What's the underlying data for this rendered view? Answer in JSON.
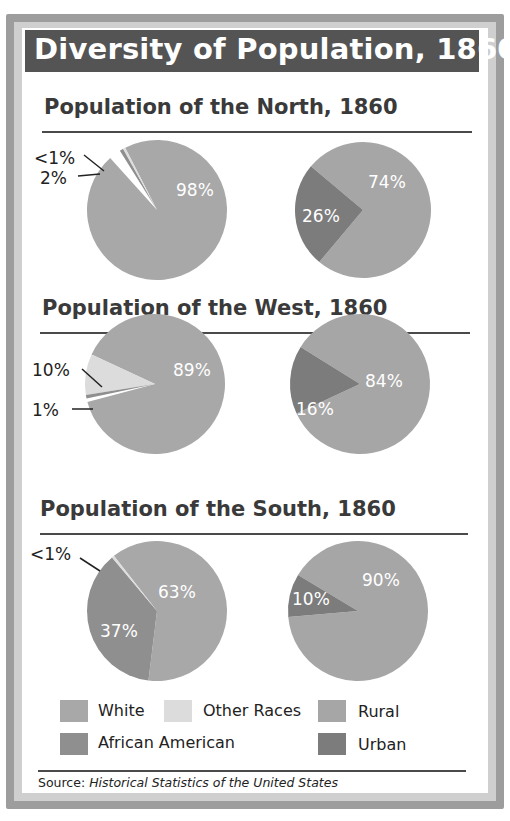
{
  "title": "Diversity of Population, 1860",
  "colors": {
    "white": "#a8a8a8",
    "african_american": "#8f8f8f",
    "other_races": "#dcdcdc",
    "rural": "#a6a6a6",
    "urban": "#7c7c7c",
    "title_bar": "#545454"
  },
  "sections": [
    {
      "heading": "Population of the North, 1860"
    },
    {
      "heading": "Population of the West, 1860"
    },
    {
      "heading": "Population of the South, 1860"
    }
  ],
  "legend": {
    "white": "White",
    "other_races": "Other Races",
    "rural": "Rural",
    "african_american": "African American",
    "urban": "Urban"
  },
  "source": {
    "prefix": "Source: ",
    "title": "Historical Statistics of the United States"
  },
  "chart_data": [
    {
      "type": "pie",
      "title": "Population of the North, 1860 — Race",
      "slices": [
        {
          "label": "White",
          "value": 98,
          "display": "98%"
        },
        {
          "label": "African American",
          "value": 2,
          "display": "2%"
        },
        {
          "label": "Other Races",
          "value": 0.5,
          "display": "<1%"
        }
      ]
    },
    {
      "type": "pie",
      "title": "Population of the North, 1860 — Rural/Urban",
      "slices": [
        {
          "label": "Rural",
          "value": 74,
          "display": "74%"
        },
        {
          "label": "Urban",
          "value": 26,
          "display": "26%"
        }
      ]
    },
    {
      "type": "pie",
      "title": "Population of the West, 1860 — Race",
      "slices": [
        {
          "label": "White",
          "value": 89,
          "display": "89%"
        },
        {
          "label": "Other Races",
          "value": 10,
          "display": "10%"
        },
        {
          "label": "African American",
          "value": 1,
          "display": "1%"
        }
      ]
    },
    {
      "type": "pie",
      "title": "Population of the West, 1860 — Rural/Urban",
      "slices": [
        {
          "label": "Rural",
          "value": 84,
          "display": "84%"
        },
        {
          "label": "Urban",
          "value": 16,
          "display": "16%"
        }
      ]
    },
    {
      "type": "pie",
      "title": "Population of the South, 1860 — Race",
      "slices": [
        {
          "label": "White",
          "value": 63,
          "display": "63%"
        },
        {
          "label": "African American",
          "value": 37,
          "display": "37%"
        },
        {
          "label": "Other Races",
          "value": 0.5,
          "display": "<1%"
        }
      ]
    },
    {
      "type": "pie",
      "title": "Population of the South, 1860 — Rural/Urban",
      "slices": [
        {
          "label": "Rural",
          "value": 90,
          "display": "90%"
        },
        {
          "label": "Urban",
          "value": 10,
          "display": "10%"
        }
      ]
    }
  ]
}
